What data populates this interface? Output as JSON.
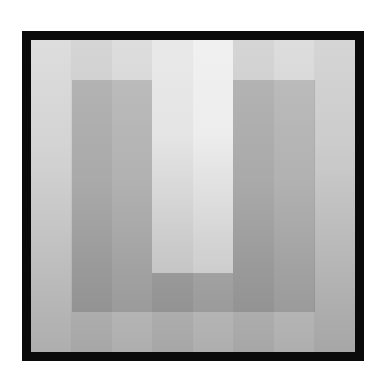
{
  "image": {
    "description": "Grayscale square artwork with thick black frame containing nested gradient bands forming a U shape",
    "colors": {
      "frame": "#0a0a0a",
      "outer_ring_top": "#dcdcdc",
      "outer_ring_bottom": "#ababab",
      "u_band_top": "#b9b9b9",
      "u_band_bottom": "#989898",
      "u_inner_top": "#efefef",
      "u_inner_bottom": "#cbcbcb",
      "background": "#ffffff"
    }
  }
}
